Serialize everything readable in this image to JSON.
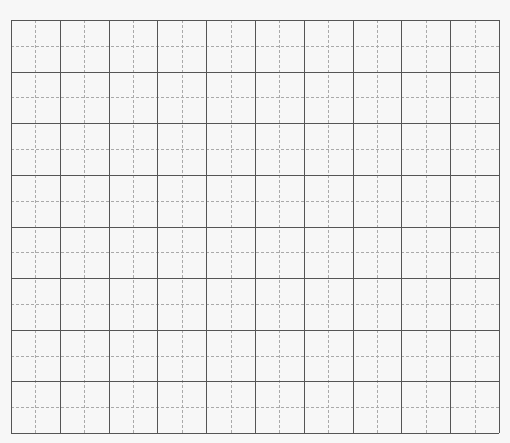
{
  "grid": {
    "major_columns": 10,
    "major_rows": 8,
    "subdivisions": 2,
    "major_line_color": "#555555",
    "minor_line_color": "#aaaaaa",
    "background_color": "#f7f7f7"
  }
}
